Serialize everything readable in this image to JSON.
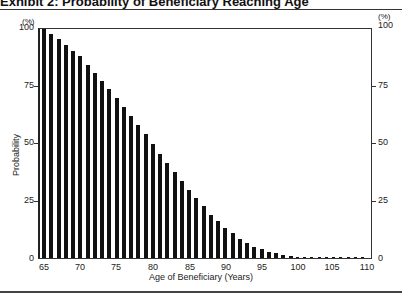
{
  "header": {
    "title": "Exhibit 2: Probability of Beneficiary Reaching Age"
  },
  "chart_data": {
    "type": "bar",
    "title": "Exhibit 2: Probability of Beneficiary Reaching Age",
    "xlabel": "Age of Beneficiary (Years)",
    "ylabel": "Probability",
    "y_unit": "(%)",
    "ylim": [
      0,
      100
    ],
    "yticks": [
      0,
      25,
      50,
      75,
      100
    ],
    "xticks": [
      65,
      70,
      75,
      80,
      85,
      90,
      95,
      100,
      105,
      110
    ],
    "grid": false,
    "dual_y_axis": true,
    "categories": [
      65,
      66,
      67,
      68,
      69,
      70,
      71,
      72,
      73,
      74,
      75,
      76,
      77,
      78,
      79,
      80,
      81,
      82,
      83,
      84,
      85,
      86,
      87,
      88,
      89,
      90,
      91,
      92,
      93,
      94,
      95,
      96,
      97,
      98,
      99,
      100,
      101,
      102,
      103,
      104,
      105,
      106,
      107,
      108,
      109,
      110
    ],
    "values": [
      100,
      98,
      95.5,
      93,
      90.5,
      88,
      84.5,
      81,
      77.5,
      74,
      70,
      66,
      62,
      58,
      54,
      50,
      45.5,
      41.5,
      37.5,
      33.5,
      29.5,
      26,
      22.5,
      19,
      16,
      13,
      11,
      8.5,
      6.5,
      5,
      3.8,
      2.8,
      2,
      1.4,
      1,
      0.6,
      0.4,
      0.25,
      0.15,
      0.1,
      0.05,
      0.03,
      0.02,
      0.01,
      0.01,
      0
    ]
  },
  "labels": {
    "unit_left": "(%)",
    "unit_right": "(%)",
    "ylabel": "Probability",
    "xlabel": "Age of Beneficiary (Years)",
    "yticks": [
      "0",
      "25",
      "50",
      "75",
      "100"
    ],
    "xticks": [
      "65",
      "70",
      "75",
      "80",
      "85",
      "90",
      "95",
      "100",
      "105",
      "110"
    ]
  }
}
